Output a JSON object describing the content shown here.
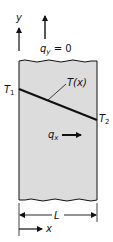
{
  "diagram": {
    "title": "",
    "labels": {
      "y_axis": "y",
      "x_axis": "x",
      "qy": "q",
      "qy_sub": "y",
      "qy_value": " = 0",
      "T1": "T",
      "T1_sub": "1",
      "T2": "T",
      "T2_sub": "2",
      "Tx": "T(x)",
      "qx": "q",
      "qx_sub": "x",
      "length": "L"
    },
    "colors": {
      "slab_fill": "#dcdcdc",
      "line": "#111111",
      "background": "#ffffff"
    }
  }
}
